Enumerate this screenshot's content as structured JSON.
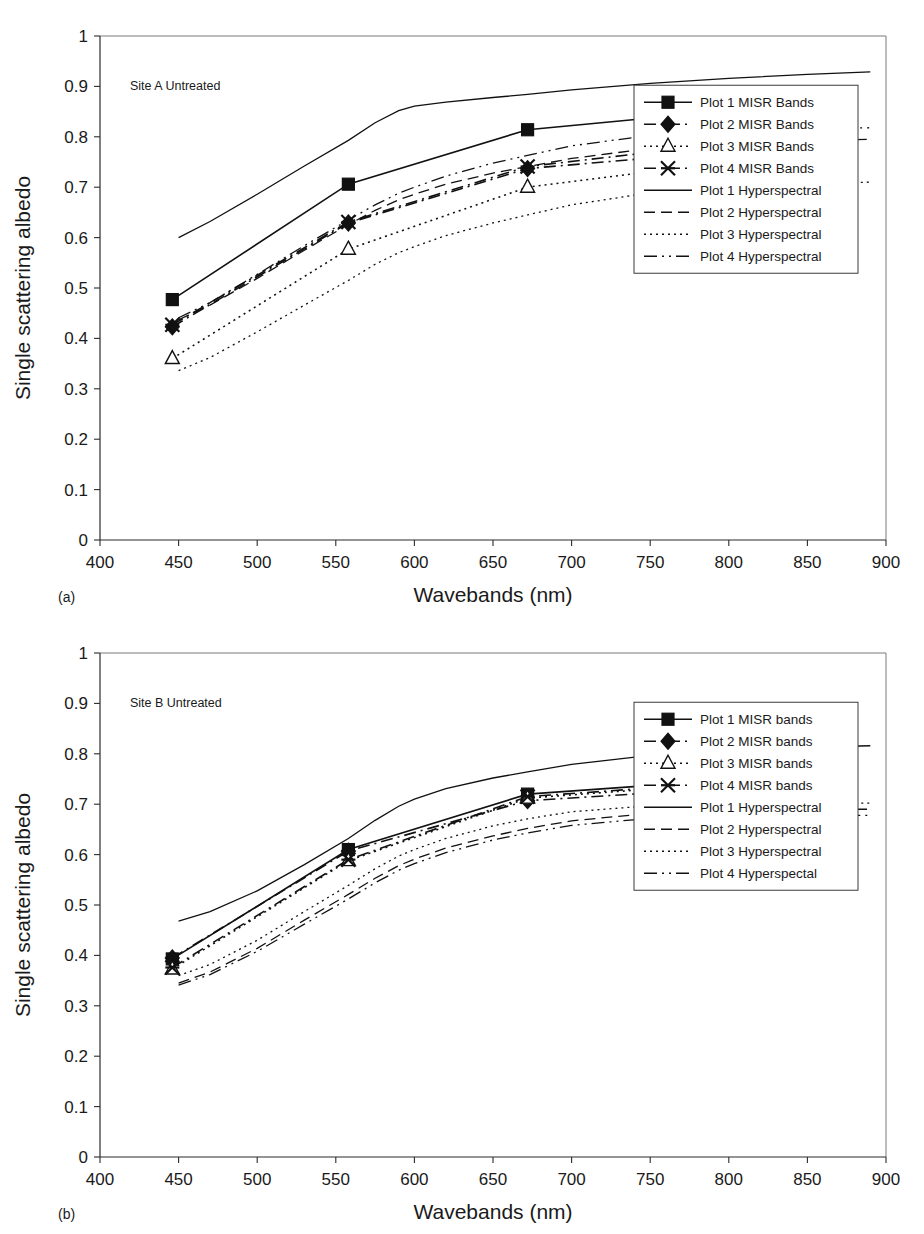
{
  "figure": {
    "panels": [
      {
        "sub_label": "(a)",
        "annotation": "Site A Untreated",
        "x_axis_title": "Wavebands (nm)",
        "y_axis_title": "Single scattering albedo",
        "legend": [
          "Plot 1 MISR Bands",
          "Plot 2 MISR Bands",
          "Plot 3 MISR Bands",
          "Plot 4 MISR Bands",
          "Plot 1 Hyperspectral",
          "Plot 2 Hyperspectral",
          "Plot 3 Hyperspectral",
          "Plot 4 Hyperspectral"
        ]
      },
      {
        "sub_label": "(b)",
        "annotation": "Site B Untreated",
        "x_axis_title": "Wavebands (nm)",
        "y_axis_title": "Single scattering albedo",
        "legend": [
          "Plot 1 MISR bands",
          "Plot 2 MISR bands",
          "Plot 3 MISR bands",
          "Plot 4 MISR bands",
          "Plot 1 Hyperspectral",
          "Plot 2 Hyperspectral",
          "Plot 3 Hyperspectral",
          "Plot 4 Hyperspectal"
        ]
      }
    ]
  },
  "chart_data": [
    {
      "type": "line",
      "title": "Site A Untreated",
      "xlabel": "Wavebands (nm)",
      "ylabel": "Single scattering albedo",
      "xlim": [
        400,
        900
      ],
      "ylim": [
        0,
        1
      ],
      "xticks": [
        400,
        450,
        500,
        550,
        600,
        650,
        700,
        750,
        800,
        850,
        900
      ],
      "yticks": [
        0,
        0.1,
        0.2,
        0.3,
        0.4,
        0.5,
        0.6,
        0.7,
        0.8,
        0.9,
        1
      ],
      "grid": false,
      "legend_position": "right-middle",
      "misr_x": [
        446,
        558,
        672,
        867
      ],
      "series": [
        {
          "name": "Plot 1 MISR Bands",
          "kind": "misr",
          "marker": "square-filled",
          "dash": "solid",
          "x": [
            446,
            558,
            672,
            867
          ],
          "values": [
            0.477,
            0.706,
            0.814,
            0.872
          ]
        },
        {
          "name": "Plot 2 MISR Bands",
          "kind": "misr",
          "marker": "diamond-filled",
          "dash": "dashdot",
          "x": [
            446,
            558,
            672,
            867
          ],
          "values": [
            0.423,
            0.629,
            0.737,
            0.789
          ]
        },
        {
          "name": "Plot 3 MISR Bands",
          "kind": "misr",
          "marker": "triangle-open",
          "dash": "dotted",
          "x": [
            446,
            558,
            672,
            867
          ],
          "values": [
            0.36,
            0.577,
            0.7,
            0.777
          ]
        },
        {
          "name": "Plot 4 MISR Bands",
          "kind": "misr",
          "marker": "star-x",
          "dash": "dashdot",
          "x": [
            446,
            558,
            672,
            867
          ],
          "values": [
            0.427,
            0.631,
            0.741,
            0.811
          ]
        },
        {
          "name": "Plot 1 Hyperspectral",
          "kind": "hyper",
          "marker": "none",
          "dash": "solid",
          "x": [
            450,
            470,
            500,
            530,
            558,
            575,
            590,
            600,
            620,
            650,
            672,
            700,
            750,
            800,
            850,
            890
          ],
          "values": [
            0.6,
            0.632,
            0.686,
            0.742,
            0.793,
            0.828,
            0.852,
            0.861,
            0.869,
            0.878,
            0.884,
            0.893,
            0.906,
            0.916,
            0.924,
            0.929
          ]
        },
        {
          "name": "Plot 2 Hyperspectral",
          "kind": "hyper",
          "marker": "none",
          "dash": "dashed",
          "x": [
            450,
            470,
            500,
            530,
            558,
            575,
            590,
            600,
            620,
            650,
            672,
            700,
            750,
            800,
            850,
            890
          ],
          "values": [
            0.437,
            0.466,
            0.519,
            0.575,
            0.626,
            0.654,
            0.675,
            0.686,
            0.706,
            0.728,
            0.741,
            0.757,
            0.777,
            0.788,
            0.793,
            0.795
          ]
        },
        {
          "name": "Plot 3 Hyperspectral",
          "kind": "hyper",
          "marker": "none",
          "dash": "dotted",
          "x": [
            450,
            470,
            500,
            530,
            558,
            575,
            590,
            600,
            620,
            650,
            672,
            700,
            750,
            800,
            850,
            890
          ],
          "values": [
            0.336,
            0.362,
            0.413,
            0.466,
            0.515,
            0.547,
            0.57,
            0.582,
            0.604,
            0.629,
            0.645,
            0.665,
            0.689,
            0.7,
            0.707,
            0.71
          ]
        },
        {
          "name": "Plot 4 Hyperspectral",
          "kind": "hyper",
          "marker": "none",
          "dash": "dashdotdot",
          "x": [
            450,
            470,
            500,
            530,
            558,
            575,
            590,
            600,
            620,
            650,
            672,
            700,
            750,
            800,
            850,
            890
          ],
          "values": [
            0.441,
            0.471,
            0.527,
            0.584,
            0.635,
            0.665,
            0.688,
            0.7,
            0.722,
            0.748,
            0.763,
            0.782,
            0.803,
            0.812,
            0.816,
            0.818
          ]
        }
      ]
    },
    {
      "type": "line",
      "title": "Site B Untreated",
      "xlabel": "Wavebands (nm)",
      "ylabel": "Single scattering albedo",
      "xlim": [
        400,
        900
      ],
      "ylim": [
        0,
        1
      ],
      "xticks": [
        400,
        450,
        500,
        550,
        600,
        650,
        700,
        750,
        800,
        850,
        900
      ],
      "yticks": [
        0,
        0.1,
        0.2,
        0.3,
        0.4,
        0.5,
        0.6,
        0.7,
        0.8,
        0.9,
        1
      ],
      "grid": false,
      "legend_position": "right-middle",
      "misr_x": [
        446,
        558,
        672,
        867
      ],
      "series": [
        {
          "name": "Plot 1 MISR bands",
          "kind": "misr",
          "marker": "square-filled",
          "dash": "solid",
          "x": [
            446,
            558,
            672,
            867
          ],
          "values": [
            0.393,
            0.61,
            0.72,
            0.763
          ]
        },
        {
          "name": "Plot 2 MISR bands",
          "kind": "misr",
          "marker": "diamond-filled",
          "dash": "dashdot",
          "x": [
            446,
            558,
            672,
            867
          ],
          "values": [
            0.395,
            0.607,
            0.707,
            0.745
          ]
        },
        {
          "name": "Plot 3 MISR bands",
          "kind": "misr",
          "marker": "triangle-open",
          "dash": "dotted",
          "x": [
            446,
            558,
            672,
            867
          ],
          "values": [
            0.373,
            0.588,
            0.712,
            0.757
          ]
        },
        {
          "name": "Plot 4 MISR bands",
          "kind": "misr",
          "marker": "star-x",
          "dash": "dashdot",
          "x": [
            446,
            558,
            672,
            867
          ],
          "values": [
            0.376,
            0.59,
            0.715,
            0.758
          ]
        },
        {
          "name": "Plot 1 Hyperspectral",
          "kind": "hyper",
          "marker": "none",
          "dash": "solid",
          "x": [
            450,
            470,
            500,
            530,
            558,
            575,
            590,
            600,
            620,
            650,
            672,
            700,
            750,
            800,
            850,
            890
          ],
          "values": [
            0.468,
            0.487,
            0.528,
            0.58,
            0.632,
            0.668,
            0.696,
            0.71,
            0.731,
            0.752,
            0.764,
            0.779,
            0.797,
            0.807,
            0.813,
            0.816
          ]
        },
        {
          "name": "Plot 2 Hyperspectral",
          "kind": "hyper",
          "marker": "none",
          "dash": "dashed",
          "x": [
            450,
            470,
            500,
            530,
            558,
            575,
            590,
            600,
            620,
            650,
            672,
            700,
            750,
            800,
            850,
            890
          ],
          "values": [
            0.345,
            0.367,
            0.414,
            0.47,
            0.521,
            0.553,
            0.578,
            0.591,
            0.613,
            0.637,
            0.652,
            0.667,
            0.682,
            0.688,
            0.69,
            0.69
          ]
        },
        {
          "name": "Plot 3 Hyperspectral",
          "kind": "hyper",
          "marker": "none",
          "dash": "dotted",
          "x": [
            450,
            470,
            500,
            530,
            558,
            575,
            590,
            600,
            620,
            650,
            672,
            700,
            750,
            800,
            850,
            890
          ],
          "values": [
            0.36,
            0.382,
            0.43,
            0.487,
            0.539,
            0.572,
            0.597,
            0.61,
            0.632,
            0.657,
            0.671,
            0.685,
            0.697,
            0.701,
            0.702,
            0.702
          ]
        },
        {
          "name": "Plot 4 Hyperspectal",
          "kind": "hyper",
          "marker": "none",
          "dash": "dashdotdot",
          "x": [
            450,
            470,
            500,
            530,
            558,
            575,
            590,
            600,
            620,
            650,
            672,
            700,
            750,
            800,
            850,
            890
          ],
          "values": [
            0.341,
            0.362,
            0.408,
            0.462,
            0.512,
            0.544,
            0.569,
            0.582,
            0.604,
            0.629,
            0.643,
            0.658,
            0.672,
            0.677,
            0.678,
            0.678
          ]
        }
      ]
    }
  ]
}
